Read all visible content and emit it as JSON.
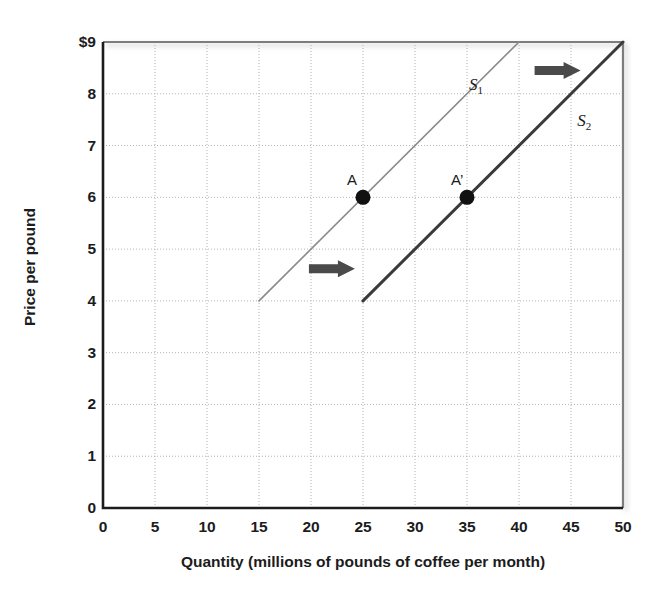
{
  "chart_data": {
    "type": "line",
    "title": "",
    "xlabel": "Quantity (millions of pounds of coffee per month)",
    "ylabel": "Price per pound",
    "xlim": [
      0,
      50
    ],
    "ylim": [
      0,
      9
    ],
    "xticks": [
      "0",
      "5",
      "10",
      "15",
      "20",
      "25",
      "30",
      "35",
      "40",
      "45",
      "50"
    ],
    "yticks": [
      "0",
      "1",
      "2",
      "3",
      "4",
      "5",
      "6",
      "7",
      "8",
      "$9"
    ],
    "grid": true,
    "grid_style": "dotted",
    "legend": "inline-labels",
    "series": [
      {
        "name": "S1",
        "label": "S",
        "sublabel": "1",
        "points": [
          [
            15,
            4
          ],
          [
            40,
            9
          ]
        ],
        "color": "#8a8a8a",
        "width": 1.6,
        "label_x": 35.2,
        "label_y": 8.15
      },
      {
        "name": "S2",
        "label": "S",
        "sublabel": "2",
        "points": [
          [
            25,
            4
          ],
          [
            50,
            9
          ]
        ],
        "color": "#3a3a3a",
        "width": 3.0,
        "label_x": 45.6,
        "label_y": 7.45
      }
    ],
    "points": [
      {
        "name": "A",
        "label": "A",
        "x": 25,
        "y": 6,
        "label_dx": -16,
        "label_dy": -26
      },
      {
        "name": "A-prime",
        "label": "A’",
        "x": 35,
        "y": 6,
        "label_dx": -16,
        "label_dy": -26
      }
    ],
    "annotations": [
      {
        "name": "shift-arrow-upper",
        "type": "arrow-right",
        "x": 41.5,
        "y": 8.45,
        "length": 46,
        "color": "#4a4a4a"
      },
      {
        "name": "shift-arrow-lower",
        "type": "arrow-right",
        "x": 19.8,
        "y": 4.62,
        "length": 46,
        "color": "#4a4a4a"
      }
    ],
    "colors": {
      "axis": "#1c1c1c",
      "grid": "#b4b4b4",
      "point": "#111111",
      "background": "#ffffff"
    }
  }
}
